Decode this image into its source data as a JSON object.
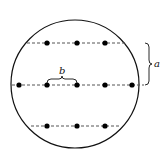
{
  "diagram": {
    "circle": {
      "cx": 75,
      "cy": 84,
      "r": 64
    },
    "rows": [
      {
        "y": 43,
        "x1": 27,
        "x2": 125,
        "dots": [
          47,
          77,
          105
        ]
      },
      {
        "y": 85,
        "x1": 12,
        "x2": 144,
        "dots": [
          19,
          47,
          77,
          105,
          132
        ]
      },
      {
        "y": 126,
        "x1": 31,
        "x2": 120,
        "dots": [
          47,
          77,
          105
        ]
      }
    ],
    "labels": {
      "row_spacing": "a",
      "dot_spacing": "b"
    },
    "colors": {
      "stroke": "#111111",
      "dash": "#555555",
      "background": "#ffffff"
    }
  }
}
